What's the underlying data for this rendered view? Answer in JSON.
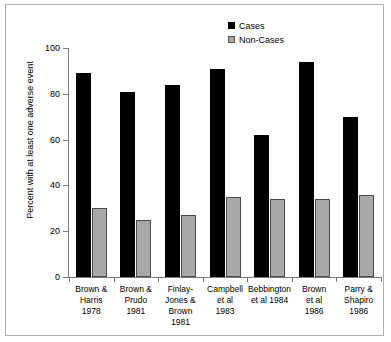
{
  "chart_data": {
    "type": "bar",
    "title": "",
    "xlabel": "",
    "ylabel": "Percent with at least one adverse event",
    "ylim": [
      0,
      100
    ],
    "yticks": [
      0,
      20,
      40,
      60,
      80,
      100
    ],
    "grid": false,
    "legend_position": "top-right",
    "categories": [
      "Brown &\nHarris\n1978",
      "Brown &\nPrudo\n1981",
      "Finlay-\nJones &\nBrown\n1981",
      "Campbell\net al\n1983",
      "Bebbington\net al 1984",
      "Brown\net al\n1986",
      "Parry &\nShapiro\n1986"
    ],
    "category_lines": [
      [
        "Brown &",
        "Harris",
        "1978"
      ],
      [
        "Brown &",
        "Prudo",
        "1981"
      ],
      [
        "Finlay-",
        "Jones &",
        "Brown",
        "1981"
      ],
      [
        "Campbell",
        "et al",
        "1983"
      ],
      [
        "Bebbington",
        "et al 1984"
      ],
      [
        "Brown",
        "et al",
        "1986"
      ],
      [
        "Parry &",
        "Shapiro",
        "1986"
      ]
    ],
    "series": [
      {
        "name": "Cases",
        "color": "#000000",
        "values": [
          89,
          81,
          84,
          91,
          62,
          94,
          70
        ]
      },
      {
        "name": "Non-Cases",
        "color": "#a8a8a8",
        "values": [
          30,
          25,
          27,
          35,
          34,
          34,
          36
        ]
      }
    ]
  },
  "legend": {
    "items": [
      {
        "label": "Cases"
      },
      {
        "label": "Non-Cases"
      }
    ]
  },
  "axes": {
    "y_title": "Percent with at least one adverse event",
    "y_tick_labels": [
      "100",
      "80",
      "60",
      "40",
      "20",
      "0"
    ]
  }
}
